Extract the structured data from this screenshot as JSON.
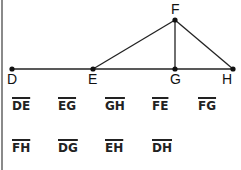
{
  "diagram": {
    "points": [
      {
        "name": "D",
        "x": 12,
        "y": 69
      },
      {
        "name": "E",
        "x": 93,
        "y": 69
      },
      {
        "name": "F",
        "x": 175,
        "y": 20
      },
      {
        "name": "G",
        "x": 175,
        "y": 69
      },
      {
        "name": "H",
        "x": 233,
        "y": 69
      }
    ],
    "lines": [
      [
        "D",
        "H"
      ],
      [
        "E",
        "F"
      ],
      [
        "F",
        "G"
      ],
      [
        "F",
        "H"
      ]
    ],
    "labels": {
      "D": "D",
      "E": "E",
      "F": "F",
      "G": "G",
      "H": "H"
    }
  },
  "segments": {
    "row1": [
      "DE",
      "EG",
      "GH",
      "FE",
      "FG"
    ],
    "row2": [
      "FH",
      "DG",
      "EH",
      "DH"
    ]
  },
  "colors": {
    "line": "#222222",
    "border": "#8a8a8a"
  }
}
